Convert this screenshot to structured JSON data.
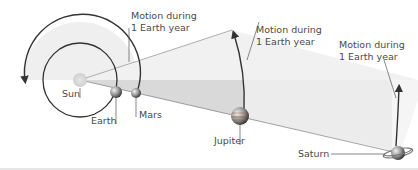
{
  "figure": {
    "colors": {
      "background": "#ffffff",
      "light_wedge": "#eeeeee",
      "grey_wedge": "#d9d9d9",
      "sun": "#d8d8d8",
      "orbit_line": "#333333",
      "label_text": "#4a4a4a",
      "leader_line": "#555555"
    },
    "bodies": [
      {
        "id": "sun",
        "label": "Sun"
      },
      {
        "id": "earth",
        "label": "Earth"
      },
      {
        "id": "mars",
        "label": "Mars"
      },
      {
        "id": "jupiter",
        "label": "Jupiter"
      },
      {
        "id": "saturn",
        "label": "Saturn"
      }
    ],
    "annotations": [
      {
        "target": "mars",
        "line1": "Motion during",
        "line2": "1 Earth year"
      },
      {
        "target": "jupiter",
        "line1": "Motion during",
        "line2": "1 Earth year"
      },
      {
        "target": "saturn",
        "line1": "Motion during",
        "line2": "1 Earth year"
      }
    ]
  }
}
